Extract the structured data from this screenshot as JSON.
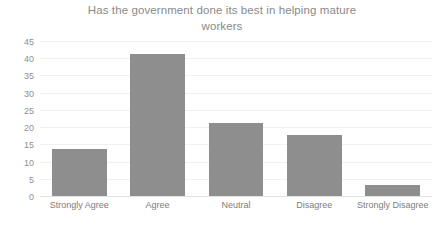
{
  "chart_data": {
    "type": "bar",
    "title": "Has the government done its best in helping mature\nworkers",
    "categories": [
      "Strongly Agree",
      "Agree",
      "Neutral",
      "Disagree",
      "Strongly Disagree"
    ],
    "values": [
      14,
      41.5,
      21.5,
      18,
      3.5
    ],
    "xlabel": "",
    "ylabel": "",
    "ylim": [
      0,
      45
    ],
    "yticks": [
      0,
      5,
      10,
      15,
      20,
      25,
      30,
      35,
      40,
      45
    ],
    "ytick_labels": [
      "0",
      "5",
      "10",
      "15",
      "20",
      "25",
      "30",
      "35",
      "40",
      "45"
    ],
    "grid": true,
    "legend": false,
    "bar_color": "#8e8e8e",
    "gridline_color": "#f0f0f0",
    "axis_color": "#e2e2e2",
    "title_color": "#8a8a8a",
    "tick_label_color": "#8f8f8f",
    "background": "#ffffff"
  }
}
